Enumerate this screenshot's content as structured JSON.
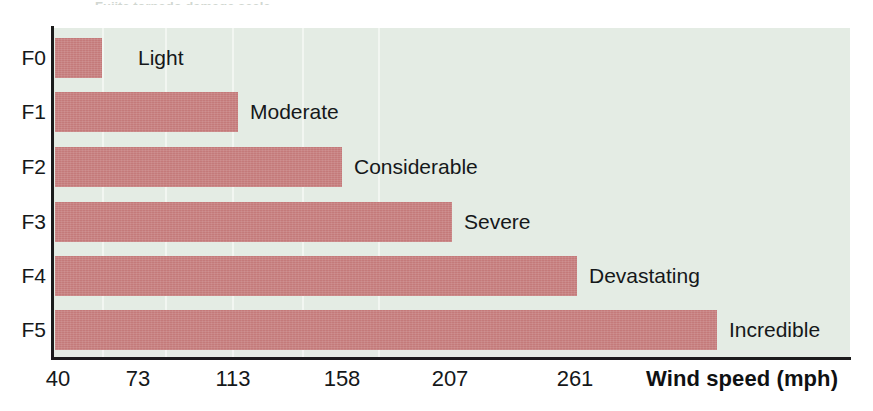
{
  "figure": {
    "title_remnant": "Fujita tornado damage scale"
  },
  "chart_data": {
    "type": "bar",
    "orientation": "horizontal",
    "title": "",
    "xlabel": "Wind speed (mph)",
    "ylabel": "",
    "grid": true,
    "legend": "none",
    "categories": [
      "F0",
      "F1",
      "F2",
      "F3",
      "F4",
      "F5"
    ],
    "values": [
      73,
      113,
      158,
      207,
      261,
      318
    ],
    "tick_labels": [
      "40",
      "73",
      "113",
      "158",
      "207",
      "261"
    ],
    "tick_values": [
      40,
      73,
      113,
      158,
      207,
      261
    ],
    "tick_positions_px": [
      53,
      102,
      165,
      232,
      302,
      378
    ],
    "bar_end_px": [
      102,
      238,
      342,
      452,
      577,
      717
    ],
    "bar_labels": [
      "Light",
      "Moderate",
      "Considerable",
      "Severe",
      "Devastating",
      "Incredible"
    ],
    "xlim": [
      40,
      400
    ],
    "colors": {
      "bar": "#c47a7a",
      "plot_background": "#e4ece4",
      "gridline": "#f2f6f1",
      "axis": "#1b1b1b",
      "text": "#15181a",
      "page_background": "#ffffff"
    }
  },
  "rows": [
    {
      "category": "F0",
      "label": "Light",
      "bar_end_px": 102,
      "top_px": 38,
      "label_offset_px": 36
    },
    {
      "category": "F1",
      "label": "Moderate",
      "bar_end_px": 238,
      "top_px": 92,
      "label_offset_px": 12
    },
    {
      "category": "F2",
      "label": "Considerable",
      "bar_end_px": 342,
      "top_px": 147,
      "label_offset_px": 12
    },
    {
      "category": "F3",
      "label": "Severe",
      "bar_end_px": 452,
      "top_px": 202,
      "label_offset_px": 12
    },
    {
      "category": "F4",
      "label": "Devastating",
      "bar_end_px": 577,
      "top_px": 256,
      "label_offset_px": 12
    },
    {
      "category": "F5",
      "label": "Incredible",
      "bar_end_px": 717,
      "top_px": 310,
      "label_offset_px": 12
    }
  ],
  "axis": {
    "ticks": [
      {
        "text": "40",
        "x_px": 58
      },
      {
        "text": "73",
        "x_px": 138
      },
      {
        "text": "113",
        "x_px": 233
      },
      {
        "text": "158",
        "x_px": 342
      },
      {
        "text": "207",
        "x_px": 450
      },
      {
        "text": "261",
        "x_px": 575
      }
    ],
    "x_title": "Wind speed (mph)"
  },
  "gridlines_px": [
    102,
    165,
    232,
    302,
    378
  ]
}
